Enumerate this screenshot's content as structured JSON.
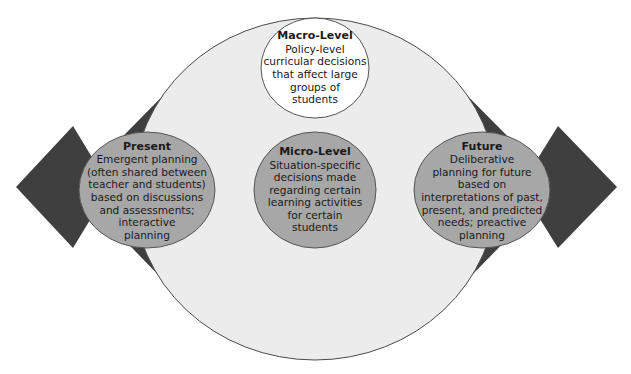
{
  "colors": {
    "arrow": "#3f3f3f",
    "big_ellipse": "#ececec",
    "gray_node": "#a7a7a7",
    "white_node": "#ffffff",
    "outline": "#555555"
  },
  "nodes": {
    "macro": {
      "title": "Macro-Level",
      "body": "Policy-level\ncurricular decisions\nthat affect large\ngroups of\nstudents"
    },
    "micro": {
      "title": "Micro-Level",
      "body": "Situation-specific\ndecisions made\nregarding certain\nlearning activities\nfor certain\nstudents"
    },
    "present": {
      "title": "Present",
      "body": "Emergent planning\n(often shared between\nteacher and students)\nbased on discussions\nand assessments;\ninteractive\nplanning"
    },
    "future": {
      "title": "Future",
      "body": "Deliberative\nplanning for future\nbased on\ninterpretations of past,\npresent, and predicted\nneeds; preactive\nplanning"
    }
  }
}
